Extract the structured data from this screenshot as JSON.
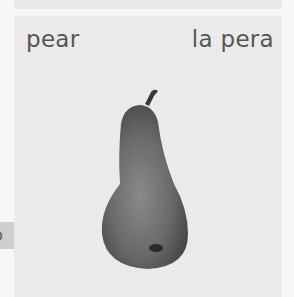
{
  "card": {
    "english_word": "pear",
    "spanish_word": "la pera",
    "image": "pear-photo"
  },
  "side_tab": {
    "partial_text": "o"
  }
}
